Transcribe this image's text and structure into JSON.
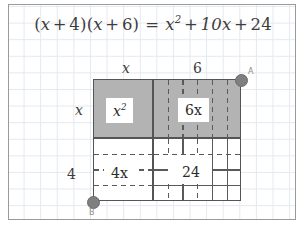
{
  "app": {
    "title": "Algebra area model — factoring",
    "background_color": "#ffffff",
    "frame_border_color": "#9a9a9a",
    "grid_color": "#e3e9f0"
  },
  "equation": {
    "full_text": "(x + 4)(x + 6) = x^2 + 10x + 24",
    "left_open_paren": "(",
    "left_var": "x",
    "left_plus": "+",
    "left_const": "4",
    "left_close_paren": ")",
    "right_open_paren": "(",
    "right_var": "x",
    "right_plus": "+",
    "right_const": "6",
    "right_close_paren": ")",
    "equals": "=",
    "term_square_base": "x",
    "term_square_exp": "2",
    "plus_1": "+",
    "term_linear": "10x",
    "plus_2": "+",
    "term_constant": "24"
  },
  "diagram": {
    "type": "area-model",
    "fill_gray": "#b3b3b3",
    "fill_white": "#ffffff",
    "stroke_color": "#555555",
    "dash_color": "#5a5a5a",
    "dimensions": {
      "top_left_label": "x",
      "top_right_label": "6",
      "left_top_label": "x",
      "left_bottom_label": "4"
    },
    "regions": [
      {
        "name": "x-squared",
        "label_base": "x",
        "label_exp": "2",
        "fill": "gray",
        "width_label": "x",
        "height_label": "x",
        "unit_cols": 0,
        "unit_rows": 0
      },
      {
        "name": "six-x",
        "label": "6x",
        "fill": "gray",
        "width_label": "6",
        "height_label": "x",
        "unit_cols": 6,
        "unit_rows": 0
      },
      {
        "name": "four-x",
        "label": "4x",
        "fill": "white",
        "width_label": "x",
        "height_label": "4",
        "unit_cols": 0,
        "unit_rows": 4
      },
      {
        "name": "twenty-four",
        "label": "24",
        "fill": "white",
        "width_label": "6",
        "height_label": "4",
        "unit_cols": 6,
        "unit_rows": 4
      }
    ],
    "points": [
      {
        "name": "A",
        "label": "A",
        "position": "top-right",
        "color": "#7f7f7f"
      },
      {
        "name": "B",
        "label": "B",
        "position": "bottom-left",
        "color": "#7f7f7f"
      }
    ]
  }
}
